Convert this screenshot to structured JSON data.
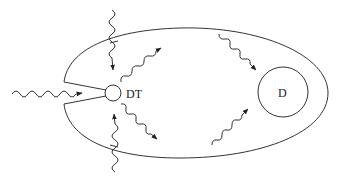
{
  "diagram": {
    "type": "schematic",
    "labels": {
      "detector": "DT",
      "target": "D"
    },
    "elements": [
      {
        "id": "cavity",
        "shape": "ellipse-with-funnel-opening",
        "description": "outer enclosure with a funnel-shaped entrance on the left"
      },
      {
        "id": "detector",
        "shape": "small-circle",
        "label": "DT"
      },
      {
        "id": "target",
        "shape": "circle",
        "label": "D"
      }
    ],
    "arrows": [
      {
        "id": "incoming-left",
        "style": "wavy",
        "direction": "into funnel toward DT"
      },
      {
        "id": "top-vertical",
        "style": "wavy",
        "direction": "downward, crossing cavity wall"
      },
      {
        "id": "bottom-vertical",
        "style": "wavy",
        "direction": "upward, crossing cavity wall"
      },
      {
        "id": "dt-up-right",
        "style": "wavy",
        "direction": "from DT up-right"
      },
      {
        "id": "dt-down-right",
        "style": "wavy",
        "direction": "from DT down-right"
      },
      {
        "id": "to-d-from-top",
        "style": "wavy",
        "direction": "toward D from upper-left"
      },
      {
        "id": "to-d-from-bottom",
        "style": "wavy",
        "direction": "toward D from lower-left"
      }
    ],
    "colors": {
      "line": "#333333",
      "background": "#ffffff"
    }
  }
}
